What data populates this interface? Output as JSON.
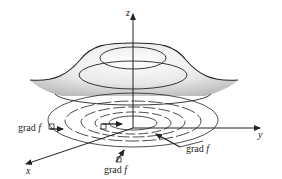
{
  "figure": {
    "type": "surface-with-level-curves",
    "axes": {
      "x_label": "x",
      "y_label": "y",
      "z_label": "z"
    },
    "gradient_labels": [
      {
        "id": "left",
        "text": "grad",
        "var": "f"
      },
      {
        "id": "bottom",
        "text": "grad",
        "var": "f"
      },
      {
        "id": "right",
        "text": "grad",
        "var": "f"
      }
    ],
    "colors": {
      "stroke": "#222222",
      "shade": "#bdbdbd",
      "background": "#ffffff"
    }
  }
}
